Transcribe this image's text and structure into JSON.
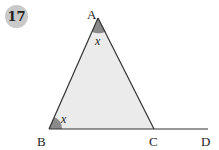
{
  "question": {
    "number": "17"
  },
  "diagram": {
    "type": "triangle-with-extended-base",
    "vertices": {
      "A": {
        "label": "A",
        "x": 98,
        "y": 18
      },
      "B": {
        "label": "B",
        "x": 49,
        "y": 129
      },
      "C": {
        "label": "C",
        "x": 154,
        "y": 129
      },
      "D": {
        "label": "D",
        "x": 208,
        "y": 129
      }
    },
    "angle_labels": {
      "A": "x",
      "B": "x"
    },
    "colors": {
      "triangle_fill": "#ebebeb",
      "angle_fill": "#8a8a8a",
      "stroke": "#333333",
      "badge": "#c9c9c9"
    }
  }
}
